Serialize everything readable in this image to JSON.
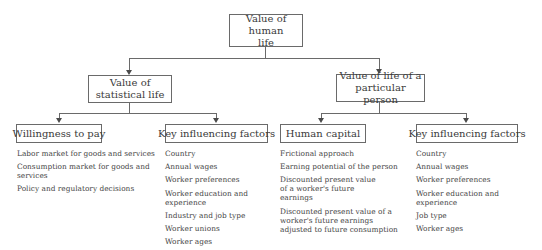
{
  "diagram": {
    "root": {
      "label_lines": [
        "Value of human",
        "life"
      ]
    },
    "level2": [
      {
        "label_lines": [
          "Value of",
          "statistical life"
        ]
      },
      {
        "label_lines": [
          "Value of life of a",
          "particular person"
        ]
      }
    ],
    "level3": [
      {
        "label": "Willingness to pay",
        "items": [
          "Labor market for goods and services",
          "Consumption market for goods and services",
          "Policy and regulatory decisions"
        ]
      },
      {
        "label": "Key influencing factors",
        "items": [
          "Country",
          "Annual wages",
          "Worker preferences",
          "Worker education and experience",
          "Industry and job type",
          "Worker unions",
          "Worker ages"
        ]
      },
      {
        "label": "Human capital",
        "items": [
          "Frictional approach",
          "Earning potential of the person",
          "Discounted present value of a worker's future earnings",
          "Discounted present value of a worker's future earnings adjusted to future consumption"
        ]
      },
      {
        "label": "Key influencing factors",
        "items": [
          "Country",
          "Annual wages",
          "Worker preferences",
          "Worker education and experience",
          "Job type",
          "Worker ages"
        ]
      }
    ]
  }
}
